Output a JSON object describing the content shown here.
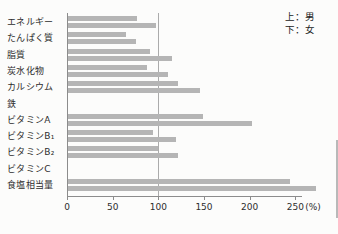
{
  "legend": {
    "top": "上：男",
    "bottom": "下：女"
  },
  "colors": {
    "bar": "#b5b5b5",
    "axis": "#8c8c8c",
    "reference_line": "#ababab",
    "text": "#2d2d2d",
    "page_edge": "#b9b9b9"
  },
  "chart_data": {
    "type": "bar",
    "orientation": "horizontal",
    "title": "",
    "xlabel": "(%)",
    "ylabel": "",
    "unit": "%",
    "xlim": [
      0,
      250
    ],
    "xticks": [
      0,
      50,
      100,
      150,
      200,
      250
    ],
    "x_axis_suffix": "(%)",
    "reference_line_x": 100,
    "grid": false,
    "legend": {
      "top": "上：男",
      "bottom": "下：女",
      "position": "top-right"
    },
    "categories": [
      "エネルギー",
      "たんぱく質",
      "脂質",
      "炭水化物",
      "カルシウム",
      "鉄",
      "ビタミンA",
      "ビタミンB₁",
      "ビタミンB₂",
      "ビタミンC",
      "食塩相当量"
    ],
    "series": [
      {
        "name": "男",
        "values": [
          76,
          63,
          90,
          87,
          120,
          null,
          148,
          93,
          99,
          null,
          243
        ]
      },
      {
        "name": "女",
        "values": [
          96,
          74,
          114,
          109,
          144,
          null,
          202,
          118,
          120,
          null,
          272
        ]
      }
    ]
  }
}
